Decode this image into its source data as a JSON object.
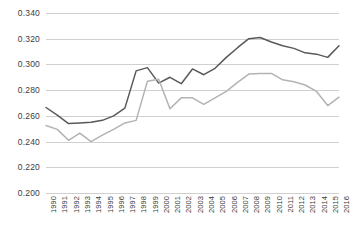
{
  "chart_data": {
    "type": "line",
    "title": "",
    "subtitle": "",
    "xlabel": "",
    "ylabel": "",
    "grid": true,
    "legend_position": "none",
    "ylim": [
      0.2,
      0.34
    ],
    "ytick_labels": [
      "0.340",
      "0.320",
      "0.300",
      "0.280",
      "0.260",
      "0.240",
      "0.220",
      "0.200"
    ],
    "ytick_values": [
      0.34,
      0.32,
      0.3,
      0.28,
      0.26,
      0.24,
      0.22,
      0.2
    ],
    "categories": [
      "1990",
      "1991",
      "1992",
      "1993",
      "1994",
      "1995",
      "1996",
      "1997",
      "1998",
      "1999",
      "2000",
      "2001",
      "2002",
      "2003",
      "2004",
      "2005",
      "2006",
      "2007",
      "2008",
      "2009",
      "2010",
      "2011",
      "2012",
      "2013",
      "2014",
      "2015",
      "2016"
    ],
    "series": [
      {
        "name": "series-dark",
        "color": "#595959",
        "values": [
          0.2665,
          0.2605,
          0.254,
          0.2545,
          0.255,
          0.2565,
          0.26,
          0.266,
          0.295,
          0.2975,
          0.2855,
          0.29,
          0.285,
          0.2965,
          0.292,
          0.297,
          0.3055,
          0.313,
          0.32,
          0.321,
          0.3175,
          0.3145,
          0.3125,
          0.309,
          0.308,
          0.3055,
          0.3145
        ]
      },
      {
        "name": "series-light",
        "color": "#b3b3b3",
        "values": [
          0.2525,
          0.2495,
          0.241,
          0.2465,
          0.24,
          0.245,
          0.2495,
          0.2545,
          0.2565,
          0.287,
          0.2885,
          0.2655,
          0.274,
          0.274,
          0.269,
          0.274,
          0.279,
          0.286,
          0.2925,
          0.293,
          0.293,
          0.288,
          0.2865,
          0.284,
          0.279,
          0.268,
          0.2745
        ]
      }
    ]
  }
}
